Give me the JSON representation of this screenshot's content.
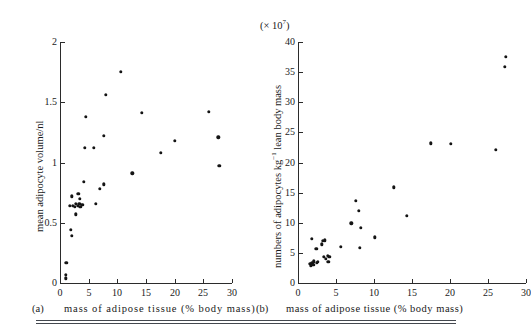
{
  "figure": {
    "background_color": "#ffffff",
    "point_color": "#141414",
    "axis_color": "#2b2b2b",
    "rule_color": "#44484f"
  },
  "panels": [
    {
      "letter": "(a)",
      "xlabel": "mass of adipose tissue (% body mass)",
      "ylabel": "mean adipocyte  volume/nl",
      "multiplier": "",
      "xticks": [
        "0",
        "5",
        "10",
        "15",
        "20",
        "25",
        "30"
      ],
      "yticks": [
        "0",
        "0.5",
        "1.0",
        "1.5",
        "2.0"
      ]
    },
    {
      "letter": "(b)",
      "xlabel": "mass of adipose tissue (% body mass)",
      "ylabel_pre": "numbers of adipocytes kg",
      "ylabel_sup": "−1",
      "ylabel_post": " lean body mass",
      "multiplier_pre": "(× 10",
      "multiplier_sup": "7",
      "multiplier_post": ")",
      "xticks": [
        "0",
        "5",
        "10",
        "15",
        "20",
        "25",
        "30"
      ],
      "yticks": [
        "0",
        "5",
        "10",
        "15",
        "20",
        "25",
        "30",
        "35",
        "40"
      ]
    }
  ],
  "chart_data": [
    {
      "type": "scatter",
      "panel": "(a)",
      "title": "",
      "xlabel": "mass of adipose tissue (% body mass)",
      "ylabel": "mean adipocyte volume/nl",
      "xlim": [
        0,
        30
      ],
      "ylim": [
        0,
        2.0
      ],
      "xticks": [
        0,
        5,
        10,
        15,
        20,
        25,
        30
      ],
      "yticks": [
        0,
        0.5,
        1.0,
        1.5,
        2.0
      ],
      "grid": false,
      "legend": false,
      "series": [
        {
          "name": "subjects",
          "points": [
            [
              1.0,
              0.04
            ],
            [
              1.05,
              0.07
            ],
            [
              1.1,
              0.17
            ],
            [
              1.9,
              0.44
            ],
            [
              2.1,
              0.39
            ],
            [
              1.75,
              0.64
            ],
            [
              2.1,
              0.72
            ],
            [
              2.2,
              0.64
            ],
            [
              2.6,
              0.63
            ],
            [
              2.7,
              0.66
            ],
            [
              2.75,
              0.57
            ],
            [
              3.1,
              0.64
            ],
            [
              3.2,
              0.74
            ],
            [
              3.35,
              0.66
            ],
            [
              3.5,
              0.7
            ],
            [
              3.55,
              0.63
            ],
            [
              3.9,
              0.65
            ],
            [
              4.1,
              0.84
            ],
            [
              4.35,
              1.12
            ],
            [
              4.5,
              1.38
            ],
            [
              5.9,
              1.12
            ],
            [
              6.3,
              0.66
            ],
            [
              6.9,
              0.78
            ],
            [
              7.6,
              0.82
            ],
            [
              7.7,
              1.22
            ],
            [
              8.0,
              1.56
            ],
            [
              10.6,
              1.75
            ],
            [
              12.6,
              0.91
            ],
            [
              14.3,
              1.41
            ],
            [
              17.6,
              1.08
            ],
            [
              20.0,
              1.18
            ],
            [
              26.0,
              1.42
            ],
            [
              27.6,
              1.21
            ],
            [
              27.8,
              0.97
            ]
          ]
        }
      ]
    },
    {
      "type": "scatter",
      "panel": "(b)",
      "title": "",
      "xlabel": "mass of adipose tissue (% body mass)",
      "ylabel": "numbers of adipocytes kg⁻¹ lean body mass",
      "y_multiplier": "× 10⁷",
      "xlim": [
        0,
        30
      ],
      "ylim": [
        0,
        40
      ],
      "xticks": [
        0,
        5,
        10,
        15,
        20,
        25,
        30
      ],
      "yticks": [
        0,
        5,
        10,
        15,
        20,
        25,
        30,
        35,
        40
      ],
      "grid": false,
      "legend": false,
      "series": [
        {
          "name": "subjects",
          "points": [
            [
              1.6,
              3.2
            ],
            [
              1.7,
              2.9
            ],
            [
              1.8,
              3.1
            ],
            [
              1.9,
              3.4
            ],
            [
              2.0,
              3.0
            ],
            [
              2.05,
              3.6
            ],
            [
              1.8,
              7.3
            ],
            [
              2.4,
              5.7
            ],
            [
              2.5,
              3.3
            ],
            [
              2.6,
              3.5
            ],
            [
              3.1,
              6.4
            ],
            [
              3.3,
              7.0
            ],
            [
              3.4,
              4.4
            ],
            [
              3.5,
              7.1
            ],
            [
              3.7,
              4.0
            ],
            [
              3.9,
              4.5
            ],
            [
              4.0,
              3.5
            ],
            [
              4.1,
              4.4
            ],
            [
              5.6,
              6.0
            ],
            [
              7.0,
              9.9
            ],
            [
              7.6,
              13.7
            ],
            [
              8.0,
              12.0
            ],
            [
              8.1,
              5.9
            ],
            [
              8.3,
              9.2
            ],
            [
              10.1,
              7.6
            ],
            [
              12.6,
              15.9
            ],
            [
              14.3,
              11.1
            ],
            [
              17.5,
              23.2
            ],
            [
              20.1,
              23.1
            ],
            [
              26.0,
              22.1
            ],
            [
              27.2,
              35.9
            ],
            [
              27.3,
              37.5
            ]
          ]
        }
      ]
    }
  ]
}
